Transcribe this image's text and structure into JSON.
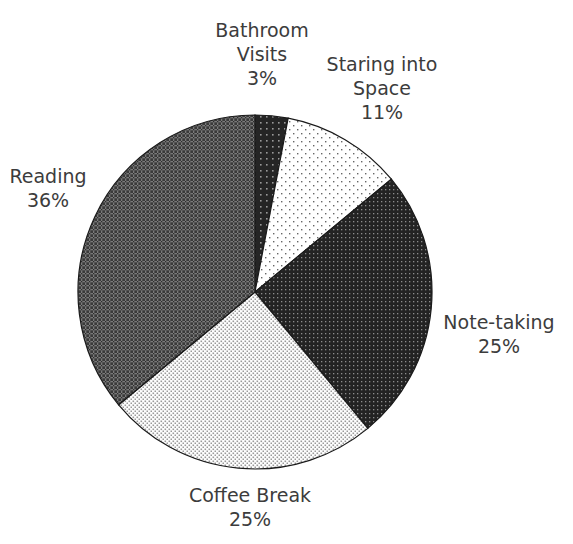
{
  "chart_data": {
    "type": "pie",
    "title": "",
    "start_angle": 0,
    "direction": "clockwise",
    "legend": "none",
    "slices": [
      {
        "label": "Bathroom Visits",
        "label_lines": [
          "Bathroom",
          "Visits",
          "3%"
        ],
        "value": 3,
        "pattern": "dark-dots",
        "fill": "#2a2a2a"
      },
      {
        "label": "Staring into Space",
        "label_lines": [
          "Staring into",
          "Space",
          "11%"
        ],
        "value": 11,
        "pattern": "sparse-dots",
        "fill": "#ffffff"
      },
      {
        "label": "Note-taking",
        "label_lines": [
          "Note-taking",
          "25%"
        ],
        "value": 25,
        "pattern": "dense-dark-dots",
        "fill": "#262626"
      },
      {
        "label": "Coffee Break",
        "label_lines": [
          "Coffee Break",
          "25%"
        ],
        "value": 25,
        "pattern": "light-dots",
        "fill": "#ffffff"
      },
      {
        "label": "Reading",
        "label_lines": [
          "Reading",
          "36%"
        ],
        "value": 36,
        "pattern": "crosshatch",
        "fill": "#5a5a5a"
      }
    ],
    "categories": [
      "Bathroom Visits",
      "Staring into Space",
      "Note-taking",
      "Coffee Break",
      "Reading"
    ],
    "values": [
      3,
      11,
      25,
      25,
      36
    ],
    "unit": "%"
  },
  "labels": {
    "bathroom": {
      "l1": "Bathroom",
      "l2": "Visits",
      "l3": "3%"
    },
    "staring": {
      "l1": "Staring into",
      "l2": "Space",
      "l3": "11%"
    },
    "notetaking": {
      "l1": "Note-taking",
      "l2": "25%"
    },
    "coffee": {
      "l1": "Coffee Break",
      "l2": "25%"
    },
    "reading": {
      "l1": "Reading",
      "l2": "36%"
    }
  }
}
